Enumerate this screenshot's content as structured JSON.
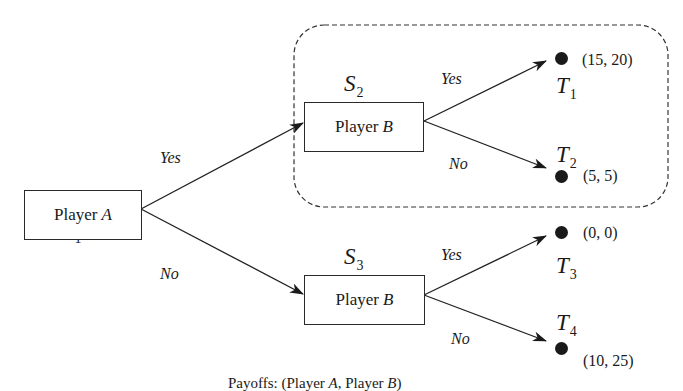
{
  "diagram": {
    "type": "game-tree",
    "nodes": {
      "s1": {
        "state": "S",
        "sub": "1",
        "player_prefix": "Player",
        "player": "A"
      },
      "s2": {
        "state": "S",
        "sub": "2",
        "player_prefix": "Player",
        "player": "B"
      },
      "s3": {
        "state": "S",
        "sub": "3",
        "player_prefix": "Player",
        "player": "B"
      }
    },
    "edges": {
      "s1_s2": "Yes",
      "s1_s3": "No",
      "s2_t1": "Yes",
      "s2_t2": "No",
      "s3_t3": "Yes",
      "s3_t4": "No"
    },
    "terminals": {
      "t1": {
        "label": "T",
        "sub": "1",
        "payoff": "(15, 20)"
      },
      "t2": {
        "label": "T",
        "sub": "2",
        "payoff": "(5, 5)"
      },
      "t3": {
        "label": "T",
        "sub": "3",
        "payoff": "(0, 0)"
      },
      "t4": {
        "label": "T",
        "sub": "4",
        "payoff": "(10, 25)"
      }
    },
    "highlight": "dashed rounded region enclosing S2 subgame",
    "caption": {
      "prefix": "Payoffs: (Player ",
      "p1": "A",
      "mid": ", Player ",
      "p2": "B",
      "suffix": ")"
    }
  }
}
